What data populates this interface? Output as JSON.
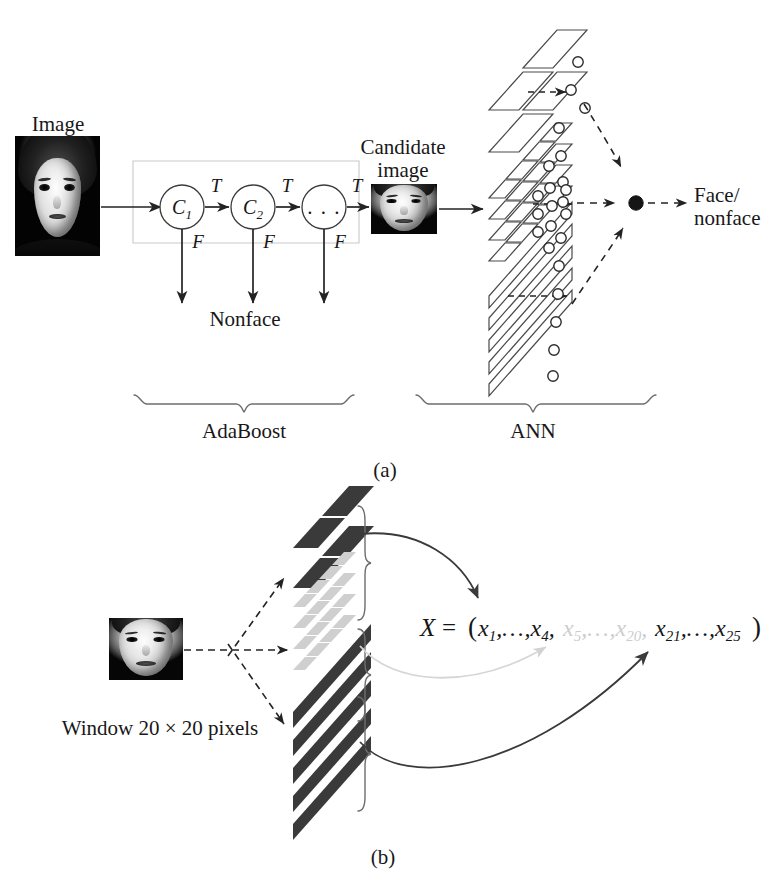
{
  "figure": {
    "panels": [
      {
        "id": "a",
        "caption": "(a)"
      },
      {
        "id": "b",
        "caption": "(b)"
      }
    ]
  },
  "panel_a": {
    "caption": "(a)",
    "labels": {
      "image": "Image",
      "candidate_image": "Candidate\nimage",
      "candidate_image_line1": "Candidate",
      "candidate_image_line2": "image",
      "nonface": "Nonface",
      "output_line1": "Face/",
      "output_line2": "nonface",
      "adaboost": "AdaBoost",
      "ann": "ANN"
    },
    "cascade": {
      "stages": [
        {
          "name": "C1",
          "base": "C",
          "sub": "1",
          "true_label": "T",
          "false_label": "F"
        },
        {
          "name": "C2",
          "base": "C",
          "sub": "2",
          "true_label": "T",
          "false_label": "F"
        },
        {
          "name": "ellipsis",
          "base": "...",
          "sub": "",
          "true_label": "T",
          "false_label": "F"
        }
      ]
    },
    "ann": {
      "feature_groups": [
        {
          "name": "coarse-blocks",
          "rows": 2,
          "cols": 2,
          "fill": "outline"
        },
        {
          "name": "medium-blocks",
          "rows": 4,
          "cols": 4,
          "fill": "outline"
        },
        {
          "name": "stripe-blocks",
          "rows": 5,
          "cols": 1,
          "fill": "outline"
        }
      ],
      "hidden_layer_label": "neuron",
      "output_node_label": "output-neuron"
    }
  },
  "panel_b": {
    "caption": "(b)",
    "labels": {
      "window": "Window 20 × 20 pixels",
      "formula_prefix": "X = (",
      "formula_seg1": "x₁,…,x₄,",
      "formula_seg2": "x₅,…,x₂₀,",
      "formula_seg3": "x₂₁,…,x₂₅",
      "formula_suffix": ")"
    },
    "formula_terms": [
      {
        "text": "X",
        "style": "italic",
        "color": "#161616"
      },
      {
        "text": "=",
        "style": "roman",
        "color": "#161616"
      },
      {
        "text": "(",
        "style": "roman",
        "color": "#161616"
      },
      {
        "text": "x1,…,x4,",
        "style": "italic",
        "color": "#161616"
      },
      {
        "text": "x5,…,x20,",
        "style": "italic",
        "color": "#c9c9c9"
      },
      {
        "text": "x21,…,x25",
        "style": "italic",
        "color": "#161616"
      },
      {
        "text": ")",
        "style": "roman",
        "color": "#161616"
      }
    ],
    "feature_groups": [
      {
        "name": "top-dark-blocks",
        "rows": 2,
        "cols": 2,
        "fill": "#3a3a3a",
        "arrow": "solid-dark"
      },
      {
        "name": "middle-light-blocks",
        "rows": 4,
        "cols": 4,
        "fill": "#cfcfcf",
        "arrow": "solid-light"
      },
      {
        "name": "bottom-stripe-blocks",
        "rows": 5,
        "cols": 1,
        "fill": "#3a3a3a",
        "arrow": "solid-dark"
      }
    ]
  },
  "colors": {
    "ink": "#161616",
    "line": "#2b2b2b",
    "dark_block": "#3a3a3a",
    "light_block": "#cfcfcf",
    "brace": "#6a6a6a",
    "cascade_box_border": "#c8c8c8",
    "light_arrow": "#d2d2d2",
    "background": "#ffffff"
  }
}
